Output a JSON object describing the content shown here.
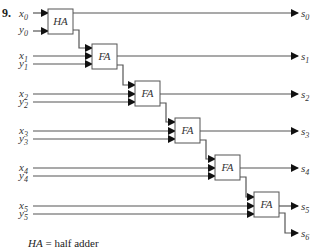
{
  "problem_number": "9.",
  "legend": {
    "abbr": "HA",
    "text": " = half adder"
  },
  "inputs": [
    {
      "x": "x",
      "xsub": "0",
      "y": "y",
      "ysub": "0"
    },
    {
      "x": "x",
      "xsub": "1",
      "y": "y",
      "ysub": "1"
    },
    {
      "x": "x",
      "xsub": "2",
      "y": "y",
      "ysub": "2"
    },
    {
      "x": "x",
      "xsub": "3",
      "y": "y",
      "ysub": "3"
    },
    {
      "x": "x",
      "xsub": "4",
      "y": "y",
      "ysub": "4"
    },
    {
      "x": "x",
      "xsub": "5",
      "y": "y",
      "ysub": "5"
    }
  ],
  "blocks": [
    {
      "label": "HA"
    },
    {
      "label": "FA"
    },
    {
      "label": "FA"
    },
    {
      "label": "FA"
    },
    {
      "label": "FA"
    },
    {
      "label": "FA"
    }
  ],
  "outputs": [
    {
      "s": "s",
      "sub": "0"
    },
    {
      "s": "s",
      "sub": "1"
    },
    {
      "s": "s",
      "sub": "2"
    },
    {
      "s": "s",
      "sub": "3"
    },
    {
      "s": "s",
      "sub": "4"
    },
    {
      "s": "s",
      "sub": "5"
    },
    {
      "s": "s",
      "sub": "6"
    }
  ]
}
